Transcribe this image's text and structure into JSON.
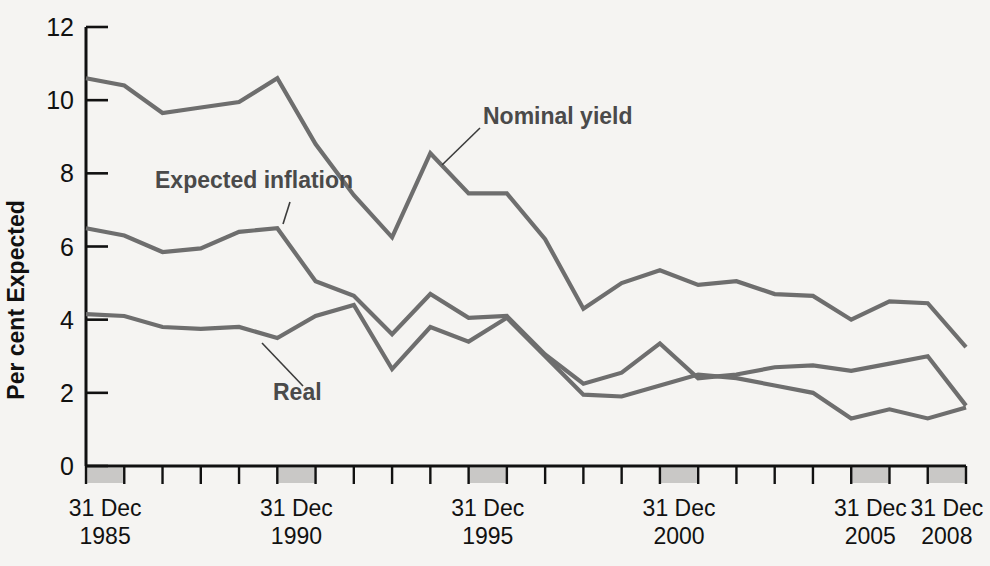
{
  "chart_data": {
    "type": "line",
    "title": "",
    "xlabel": "",
    "ylabel": "Per cent Expected",
    "ylim": [
      0,
      12
    ],
    "yticks": [
      0,
      2,
      4,
      6,
      8,
      10,
      12
    ],
    "ytick_labels": [
      "0",
      "2",
      "4",
      "6",
      "8",
      "10",
      "12"
    ],
    "grid": false,
    "legend_position": "inline-annotations",
    "x": [
      1985,
      1986,
      1987,
      1988,
      1989,
      1990,
      1991,
      1992,
      1993,
      1994,
      1995,
      1996,
      1997,
      1998,
      1999,
      2000,
      2001,
      2002,
      2003,
      2004,
      2005,
      2006,
      2007,
      2008
    ],
    "x_tick_positions": [
      1985,
      1990,
      1995,
      2000,
      2005,
      2008
    ],
    "x_tick_labels": [
      {
        "line1": "31 Dec",
        "line2": "1985"
      },
      {
        "line1": "31 Dec",
        "line2": "1990"
      },
      {
        "line1": "31 Dec",
        "line2": "1995"
      },
      {
        "line1": "31 Dec",
        "line2": "2000"
      },
      {
        "line1": "31 Dec",
        "line2": "2005"
      },
      {
        "line1": "31 Dec",
        "line2": "2008"
      }
    ],
    "series": [
      {
        "name": "Nominal yield",
        "color": "#6e6e6e",
        "values": [
          10.6,
          10.4,
          9.65,
          9.8,
          9.95,
          10.6,
          8.8,
          7.4,
          6.25,
          8.55,
          7.45,
          7.45,
          6.2,
          4.3,
          5.0,
          5.35,
          4.95,
          5.05,
          4.7,
          4.65,
          4.0,
          4.5,
          4.45,
          3.25
        ]
      },
      {
        "name": "Expected inflation",
        "color": "#6e6e6e",
        "values": [
          6.5,
          6.3,
          5.85,
          5.95,
          6.4,
          6.5,
          5.05,
          4.65,
          3.6,
          4.7,
          4.05,
          4.1,
          3.05,
          2.25,
          2.55,
          3.35,
          2.4,
          2.5,
          2.7,
          2.75,
          2.6,
          2.8,
          3.0,
          1.65
        ]
      },
      {
        "name": "Real",
        "color": "#6e6e6e",
        "values": [
          4.15,
          4.1,
          3.8,
          3.75,
          3.8,
          3.5,
          4.1,
          4.4,
          2.65,
          3.8,
          3.4,
          4.05,
          3.0,
          1.95,
          1.9,
          2.2,
          2.5,
          2.4,
          2.2,
          2.0,
          1.3,
          1.55,
          1.3,
          1.6
        ]
      }
    ],
    "annotations": [
      {
        "text": "Nominal yield",
        "target_series": "Nominal yield"
      },
      {
        "text": "Expected inflation",
        "target_series": "Expected inflation"
      },
      {
        "text": "Real",
        "target_series": "Real"
      }
    ]
  }
}
